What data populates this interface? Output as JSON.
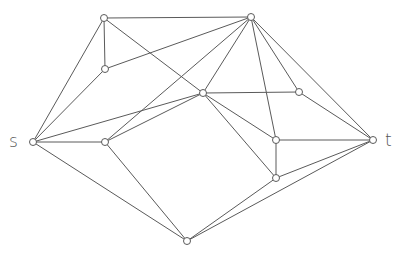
{
  "diagram": {
    "type": "undirected-graph",
    "colors": {
      "edge": "#5a5a5a",
      "node_fill": "#ffffff",
      "node_stroke": "#5a5a5a",
      "label": "#555555"
    },
    "node_radius": 3.5,
    "labels": [
      {
        "id": "s",
        "text": "s",
        "x": 9,
        "y": 147
      },
      {
        "id": "t",
        "text": "t",
        "x": 385,
        "y": 146
      }
    ],
    "nodes": [
      {
        "id": "s",
        "x": 33,
        "y": 142
      },
      {
        "id": "a",
        "x": 104,
        "y": 18
      },
      {
        "id": "b",
        "x": 105,
        "y": 69
      },
      {
        "id": "c",
        "x": 105,
        "y": 142
      },
      {
        "id": "d",
        "x": 251,
        "y": 17
      },
      {
        "id": "e",
        "x": 203,
        "y": 93
      },
      {
        "id": "f",
        "x": 299,
        "y": 92
      },
      {
        "id": "g",
        "x": 276,
        "y": 140
      },
      {
        "id": "h",
        "x": 276,
        "y": 178
      },
      {
        "id": "i",
        "x": 187,
        "y": 241
      },
      {
        "id": "t",
        "x": 373,
        "y": 140
      }
    ],
    "edges": [
      [
        "s",
        "a"
      ],
      [
        "s",
        "b"
      ],
      [
        "s",
        "e"
      ],
      [
        "s",
        "c"
      ],
      [
        "s",
        "i"
      ],
      [
        "a",
        "d"
      ],
      [
        "a",
        "b"
      ],
      [
        "a",
        "e"
      ],
      [
        "b",
        "d"
      ],
      [
        "c",
        "e"
      ],
      [
        "c",
        "d"
      ],
      [
        "c",
        "i"
      ],
      [
        "d",
        "e"
      ],
      [
        "d",
        "f"
      ],
      [
        "d",
        "g"
      ],
      [
        "d",
        "t"
      ],
      [
        "e",
        "f"
      ],
      [
        "e",
        "g"
      ],
      [
        "e",
        "h"
      ],
      [
        "f",
        "t"
      ],
      [
        "g",
        "t"
      ],
      [
        "g",
        "h"
      ],
      [
        "h",
        "t"
      ],
      [
        "h",
        "i"
      ],
      [
        "i",
        "t"
      ]
    ]
  }
}
